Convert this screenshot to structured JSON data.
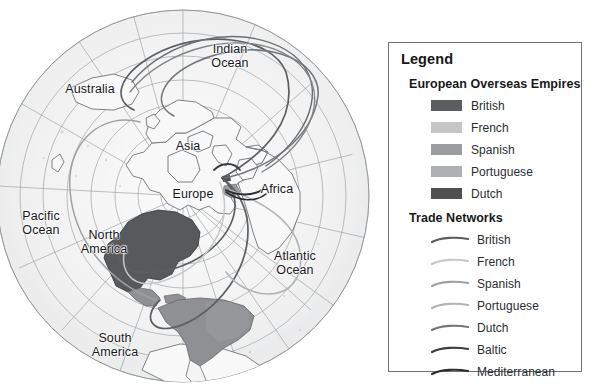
{
  "figure": {
    "kind": "world-map-with-legend",
    "projection": "polar azimuthal, north-pole centered"
  },
  "map": {
    "labels": [
      {
        "name": "label-indian-ocean",
        "text": "Indian\nOcean",
        "x": 228,
        "y": 48
      },
      {
        "name": "label-australia",
        "text": "Australia",
        "x": 88,
        "y": 82
      },
      {
        "name": "label-asia",
        "text": "Asia",
        "x": 186,
        "y": 139
      },
      {
        "name": "label-europe",
        "text": "Europe",
        "x": 192,
        "y": 187
      },
      {
        "name": "label-africa",
        "text": "Africa",
        "x": 275,
        "y": 182
      },
      {
        "name": "label-pacific-ocean",
        "text": "Pacific\nOcean",
        "x": 32,
        "y": 209
      },
      {
        "name": "label-north-america",
        "text": "North\nAmerica",
        "x": 98,
        "y": 228
      },
      {
        "name": "label-atlantic-ocean",
        "text": "Atlantic\nOcean",
        "x": 289,
        "y": 249
      },
      {
        "name": "label-south-america",
        "text": "South\nAmerica",
        "x": 110,
        "y": 331
      }
    ],
    "colors": {
      "ocean": "#efefef",
      "land": "#f7f7f7",
      "graticule": "#9aa0a4",
      "coastline": "#6e7478",
      "globe_edge": "#8d9499",
      "empire_british": "#58595b",
      "empire_spanish": "#8e9093",
      "empire_portuguese": "#a5a7aa"
    }
  },
  "legend": {
    "title": "Legend",
    "empires": {
      "heading": "European Overseas Empires",
      "items": [
        {
          "label": "British",
          "color": "#5b5d5f"
        },
        {
          "label": "French",
          "color": "#c3c5c7"
        },
        {
          "label": "Spanish",
          "color": "#9b9da0"
        },
        {
          "label": "Portuguese",
          "color": "#aeb0b3"
        },
        {
          "label": "Dutch",
          "color": "#4e5052"
        }
      ]
    },
    "networks": {
      "heading": "Trade Networks",
      "items": [
        {
          "label": "British",
          "color": "#5c5f62"
        },
        {
          "label": "French",
          "color": "#c6c8ca"
        },
        {
          "label": "Spanish",
          "color": "#9ea1a4"
        },
        {
          "label": "Portuguese",
          "color": "#b1b4b6"
        },
        {
          "label": "Dutch",
          "color": "#73767a"
        },
        {
          "label": "Baltic",
          "color": "#3b3d40"
        },
        {
          "label": "Mediterranean",
          "color": "#2a2c2e"
        }
      ]
    }
  }
}
